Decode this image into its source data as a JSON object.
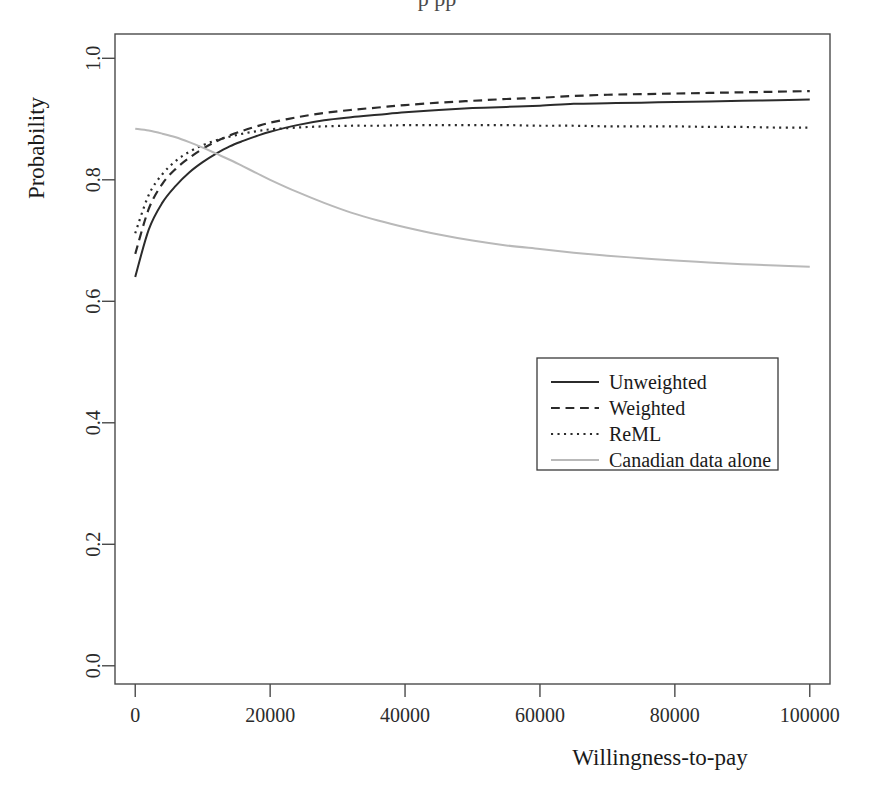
{
  "figure": {
    "partial_title_fragment": "p    pp"
  },
  "chart_data": {
    "type": "line",
    "title": "",
    "xlabel": "Willingness-to-pay",
    "ylabel": "Probability",
    "xlim": [
      -3000,
      103000
    ],
    "ylim": [
      -0.03,
      1.04
    ],
    "grid": false,
    "legend_position": "center-right",
    "xticks": [
      0,
      20000,
      40000,
      60000,
      80000,
      100000
    ],
    "xticklabels": [
      "0",
      "20000",
      "40000",
      "60000",
      "80000",
      "100000"
    ],
    "yticks": [
      0.0,
      0.2,
      0.4,
      0.6,
      0.8,
      1.0
    ],
    "yticklabels": [
      "0.0",
      "0.2",
      "0.4",
      "0.6",
      "0.8",
      "1.0"
    ],
    "x": [
      0,
      2000,
      4000,
      6000,
      8000,
      10000,
      12000,
      14000,
      16000,
      18000,
      20000,
      24000,
      28000,
      32000,
      36000,
      40000,
      45000,
      50000,
      55000,
      60000,
      65000,
      70000,
      75000,
      80000,
      85000,
      90000,
      95000,
      100000
    ],
    "series": [
      {
        "name": "Unweighted",
        "style": "solid",
        "color": "#2b2b2b",
        "width": 2.0,
        "values": [
          0.64,
          0.718,
          0.762,
          0.79,
          0.812,
          0.829,
          0.843,
          0.855,
          0.864,
          0.872,
          0.879,
          0.89,
          0.898,
          0.903,
          0.907,
          0.911,
          0.915,
          0.918,
          0.92,
          0.922,
          0.925,
          0.926,
          0.927,
          0.928,
          0.929,
          0.93,
          0.931,
          0.932
        ]
      },
      {
        "name": "Weighted",
        "style": "dashed",
        "color": "#2b2b2b",
        "width": 2.2,
        "values": [
          0.678,
          0.752,
          0.793,
          0.818,
          0.836,
          0.851,
          0.863,
          0.873,
          0.881,
          0.888,
          0.894,
          0.903,
          0.91,
          0.915,
          0.919,
          0.923,
          0.927,
          0.93,
          0.933,
          0.935,
          0.938,
          0.94,
          0.941,
          0.942,
          0.943,
          0.944,
          0.945,
          0.946
        ]
      },
      {
        "name": "ReML",
        "style": "dotted",
        "color": "#2b2b2b",
        "width": 2.2,
        "values": [
          0.712,
          0.775,
          0.809,
          0.831,
          0.846,
          0.857,
          0.865,
          0.871,
          0.876,
          0.88,
          0.883,
          0.886,
          0.888,
          0.889,
          0.889,
          0.89,
          0.89,
          0.89,
          0.89,
          0.889,
          0.889,
          0.888,
          0.888,
          0.888,
          0.887,
          0.887,
          0.886,
          0.886
        ]
      },
      {
        "name": "Canadian data alone",
        "style": "solid",
        "color": "#b9b9b9",
        "width": 2.0,
        "values": [
          0.884,
          0.881,
          0.876,
          0.87,
          0.862,
          0.853,
          0.843,
          0.833,
          0.822,
          0.811,
          0.8,
          0.78,
          0.762,
          0.746,
          0.733,
          0.722,
          0.71,
          0.7,
          0.692,
          0.686,
          0.68,
          0.675,
          0.671,
          0.667,
          0.664,
          0.661,
          0.659,
          0.657
        ]
      }
    ]
  },
  "legend": {
    "entries": [
      {
        "label": "Unweighted"
      },
      {
        "label": "Weighted"
      },
      {
        "label": "ReML"
      },
      {
        "label": "Canadian data alone"
      }
    ]
  }
}
